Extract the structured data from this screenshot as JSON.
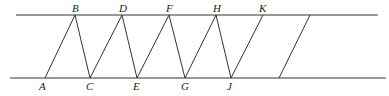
{
  "diagram": {
    "type": "geometry",
    "parallel_lines": {
      "top": {
        "x1": 16,
        "y": 15,
        "x2": 378
      },
      "bottom": {
        "x1": 10,
        "y": 78,
        "x2": 386
      }
    },
    "points": {
      "A": {
        "x": 45,
        "y": 78,
        "label": "A"
      },
      "B": {
        "x": 75,
        "y": 15,
        "label": "B"
      },
      "C": {
        "x": 90,
        "y": 78,
        "label": "C"
      },
      "D": {
        "x": 122,
        "y": 15,
        "label": "D"
      },
      "E": {
        "x": 137,
        "y": 78,
        "label": "E"
      },
      "F": {
        "x": 169,
        "y": 15,
        "label": "F"
      },
      "G": {
        "x": 185,
        "y": 78,
        "label": "G"
      },
      "H": {
        "x": 216,
        "y": 15,
        "label": "H"
      },
      "J": {
        "x": 231,
        "y": 78,
        "label": "J"
      },
      "K": {
        "x": 263,
        "y": 15,
        "label": "K"
      }
    },
    "segments": [
      [
        "A",
        "B"
      ],
      [
        "B",
        "C"
      ],
      [
        "C",
        "D"
      ],
      [
        "D",
        "E"
      ],
      [
        "E",
        "F"
      ],
      [
        "F",
        "G"
      ],
      [
        "G",
        "H"
      ],
      [
        "H",
        "J"
      ],
      [
        "J",
        "K"
      ]
    ],
    "extra_segment": {
      "x1": 310,
      "y1": 15,
      "x2": 279,
      "y2": 78
    },
    "labels": [
      "A",
      "B",
      "C",
      "D",
      "E",
      "F",
      "G",
      "H",
      "J",
      "K"
    ]
  }
}
